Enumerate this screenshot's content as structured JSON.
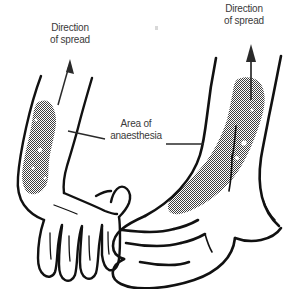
{
  "figure": {
    "background_color": "#ffffff",
    "ink_color": "#111111",
    "text_color": "#3a3a3a",
    "stipple_color": "#4a4a4a",
    "width": 296,
    "height": 289
  },
  "labels": {
    "spread_hand": {
      "line1": "Direction",
      "line2": "of spread"
    },
    "spread_foot": {
      "line1": "Direction",
      "line2": "of spread"
    },
    "area": {
      "line1": "Area of",
      "line2": "anaesthesia"
    }
  },
  "annotations": {
    "arrow_hand": "arrow pointing up and slightly right from the shaded forearm band",
    "arrow_foot": "vertical arrow pointing up from the shaded ankle band",
    "leader_left": "leader line from the Area of anaesthesia label to the hand shading",
    "leader_right": "leader line from the Area of anaesthesia label to the foot shading"
  },
  "diagram_parts": [
    {
      "name": "hand",
      "side": "left",
      "description": "dorsum of hand and forearm with four fingers and thumb"
    },
    {
      "name": "foot",
      "side": "right",
      "description": "medial view of foot and ankle with toes"
    }
  ]
}
